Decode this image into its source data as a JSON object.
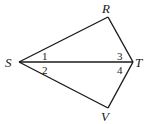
{
  "diagram": {
    "points": {
      "R": {
        "label": "R",
        "x": 108,
        "y": 17
      },
      "S": {
        "label": "S",
        "x": 19,
        "y": 62
      },
      "T": {
        "label": "T",
        "x": 133,
        "y": 62
      },
      "V": {
        "label": "V",
        "x": 108,
        "y": 108
      }
    },
    "segments": [
      "SR",
      "RT",
      "ST",
      "SV",
      "VT"
    ],
    "angles": [
      {
        "label": "1",
        "vertex": "S",
        "between": [
          "R",
          "T"
        ]
      },
      {
        "label": "2",
        "vertex": "S",
        "between": [
          "T",
          "V"
        ]
      },
      {
        "label": "3",
        "vertex": "T",
        "between": [
          "R",
          "S"
        ]
      },
      {
        "label": "4",
        "vertex": "T",
        "between": [
          "S",
          "V"
        ]
      }
    ],
    "stroke_color": "#1a1a1a"
  }
}
